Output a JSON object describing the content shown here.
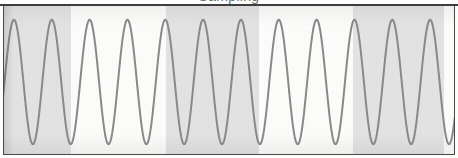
{
  "figure": {
    "caption_clipped": "Sampling",
    "frame_color": "#4a4a4a",
    "paper_color": "#fbfbfa"
  },
  "chart_data": {
    "type": "line",
    "title": "",
    "xlabel": "",
    "ylabel": "",
    "grid": false,
    "legend": null,
    "xlim": [
      0,
      458
    ],
    "ylim": [
      -1,
      1
    ],
    "waveform": {
      "shape": "sine",
      "cycles": 12,
      "period_px": 38,
      "phase_offset_px": 13,
      "peak_y_px": 18,
      "trough_y_px": 145,
      "amplitude_px": 63.5,
      "midline_y_px": 81.5,
      "line_color": "#8a8a8a",
      "line_width_px": 2
    },
    "background_bands": [
      {
        "index": 0,
        "x_start": 0,
        "x_end": 70,
        "fill": "#e3e3e3",
        "shaded": true
      },
      {
        "index": 1,
        "x_start": 70,
        "x_end": 165,
        "fill": "#fcfcfb",
        "shaded": false
      },
      {
        "index": 2,
        "x_start": 165,
        "x_end": 258,
        "fill": "#e3e3e3",
        "shaded": true
      },
      {
        "index": 3,
        "x_start": 258,
        "x_end": 352,
        "fill": "#fcfcfb",
        "shaded": false
      },
      {
        "index": 4,
        "x_start": 352,
        "x_end": 443,
        "fill": "#e3e3e3",
        "shaded": true
      },
      {
        "index": 5,
        "x_start": 443,
        "x_end": 452,
        "fill": "#fcfcfb",
        "shaded": false
      }
    ],
    "colors": {
      "shaded_band": "#e3e3e3",
      "plain_band": "#fcfcfb",
      "line": "#8a8a8a",
      "frame": "#4a4a4a"
    }
  }
}
